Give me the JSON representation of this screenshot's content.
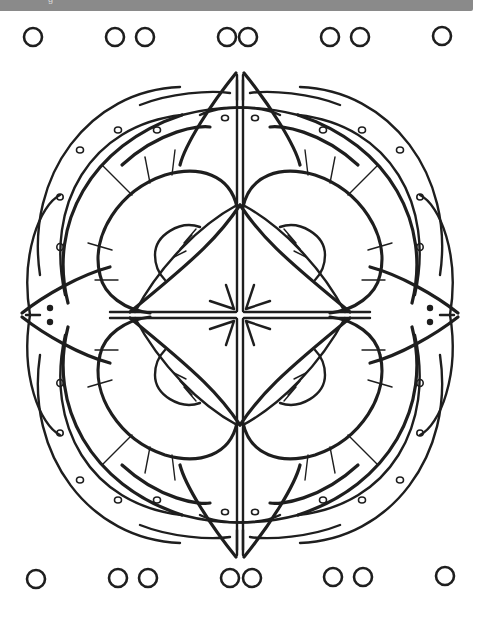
{
  "page": {
    "background_color": "#ffffff",
    "ink_color": "#1e1e1e"
  },
  "topbar": {
    "color": "#8a8a8a",
    "text": "g"
  },
  "border_ornaments": {
    "top_row": [
      "single-ring",
      "double-ring-separated",
      "double-ring-linked",
      "double-ring-separated",
      "single-ring"
    ],
    "bottom_row": [
      "single-ring",
      "double-ring-separated",
      "double-ring-linked",
      "double-ring-separated",
      "single-ring"
    ]
  },
  "mandala": {
    "symmetry": "4-fold",
    "center_motif": "eight-point-starburst",
    "quadrant_motifs": [
      "outer-petal-with-dots",
      "inner-lobe",
      "half-circle-with-rays"
    ],
    "point_motifs": [
      "top-spear-with-two-dots",
      "right-spear-with-two-dots",
      "bottom-spear-with-two-dots",
      "left-spear-with-two-dots"
    ]
  }
}
